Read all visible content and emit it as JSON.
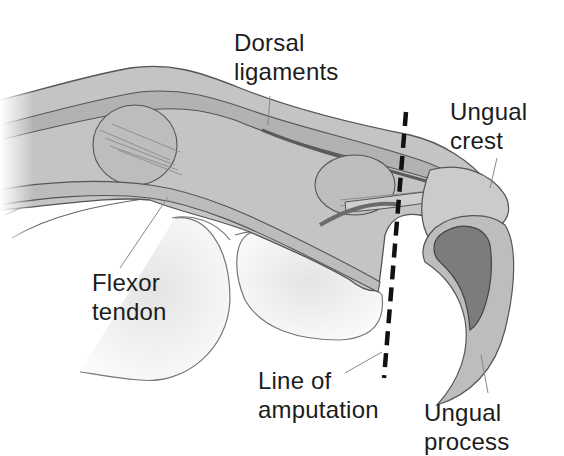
{
  "diagram": {
    "labels": [
      {
        "id": "dorsal-ligaments",
        "lines": [
          "Dorsal",
          "ligaments"
        ]
      },
      {
        "id": "ungual-crest",
        "lines": [
          "Ungual",
          "crest"
        ]
      },
      {
        "id": "flexor-tendon",
        "lines": [
          "Flexor",
          "tendon"
        ]
      },
      {
        "id": "line-of-amputation",
        "lines": [
          "Line of",
          "amputation"
        ]
      },
      {
        "id": "ungual-process",
        "lines": [
          "Ungual",
          "process"
        ]
      }
    ],
    "colors": {
      "background": "#ffffff",
      "tissue_light": "#c9c9c9",
      "tissue_mid": "#a9a9a9",
      "tissue_dark": "#7a7a7a",
      "outline": "#555555",
      "claw_dark": "#6e6e6e",
      "dash_line": "#111111",
      "text": "#1c1c1c"
    }
  }
}
